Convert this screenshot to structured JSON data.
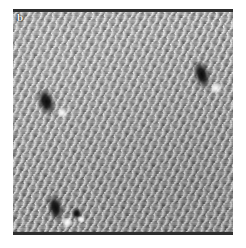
{
  "figure": {
    "panel_label": "b",
    "image_type": "scanning-probe-micrograph",
    "frame": {
      "left_px": 13,
      "top_px": 9,
      "width_px": 220,
      "height_px": 226
    },
    "colors": {
      "background": "#ffffff",
      "lattice_mean_gray": "#7e7e7e",
      "lattice_bright": "#f5f5f5",
      "lattice_dark": "#3c3c3c",
      "defect_dark": "#050505",
      "defect_bright": "#ffffff",
      "scan_edge": "#2e2e2e",
      "label_text": "#f2f2f2"
    },
    "lattice": {
      "description": "oblique atomic lattice of bright protrusions",
      "spacing_a_px": 9.2,
      "spacing_b_px": 8.0,
      "row_angle_deg": -27,
      "row_direction": "upper-left to lower-right"
    },
    "defects": [
      {
        "name": "defect-left",
        "left_px": 26,
        "top_px": 80,
        "width_px": 16,
        "height_px": 30,
        "rotation_deg": -18,
        "bright_left_px": 16,
        "bright_top_px": 24,
        "bright_size_px": 8
      },
      {
        "name": "defect-upper-right",
        "left_px": 182,
        "top_px": 52,
        "width_px": 15,
        "height_px": 32,
        "rotation_deg": -16,
        "bright_left_px": 13,
        "bright_top_px": 26,
        "bright_size_px": 9
      },
      {
        "name": "defect-bottom-left",
        "left_px": 36,
        "top_px": 186,
        "width_px": 14,
        "height_px": 30,
        "rotation_deg": -12,
        "bright_left_px": 11,
        "bright_top_px": 25,
        "bright_size_px": 9
      },
      {
        "name": "defect-bottom-small",
        "left_px": 59,
        "top_px": 199,
        "width_px": 10,
        "height_px": 13,
        "rotation_deg": -10,
        "bright_left_px": 5,
        "bright_top_px": 9,
        "bright_size_px": 6
      }
    ]
  }
}
